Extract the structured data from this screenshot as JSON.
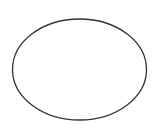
{
  "canvas": {
    "width": 157,
    "height": 131,
    "background": "#ffffff"
  },
  "shapes": [
    {
      "type": "ellipse",
      "cx": 79.5,
      "cy": 69.5,
      "rx": 67,
      "ry": 50.5,
      "stroke": "#333333",
      "stroke_width": 1.3,
      "fill": "none"
    }
  ]
}
